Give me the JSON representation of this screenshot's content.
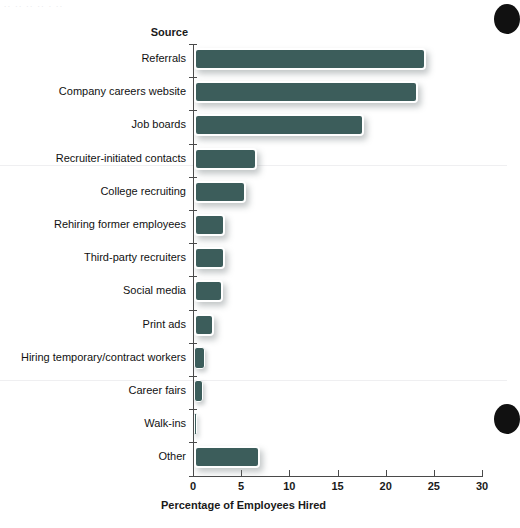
{
  "chart_data": {
    "type": "bar",
    "orientation": "horizontal",
    "title": "",
    "subtitle": "",
    "xlabel": "Percentage of Employees Hired",
    "ylabel": "Source",
    "xlim": [
      0,
      30
    ],
    "xticks": [
      0,
      5,
      10,
      15,
      20,
      25,
      30
    ],
    "xtick_labels": [
      "0",
      "5",
      "10",
      "15",
      "20",
      "25",
      "30"
    ],
    "grid": false,
    "legend": false,
    "bar_color": "#3c5d5b",
    "bar_outline_color": "#ffffff",
    "categories": [
      "Referrals",
      "Company careers website",
      "Job boards",
      "Recruiter-initiated contacts",
      "College recruiting",
      "Rehiring former employees",
      "Third-party recruiters",
      "Social media",
      "Print ads",
      "Hiring temporary/contract workers",
      "Career fairs",
      "Walk-ins",
      "Other"
    ],
    "values": [
      24.1,
      23.3,
      17.6,
      6.5,
      5.4,
      3.2,
      3.2,
      3.0,
      2.1,
      1.1,
      0.9,
      0.1,
      6.8
    ]
  },
  "axis": {
    "source_header": "Source",
    "x_title": "Percentage of Employees Hired"
  },
  "artifacts": {
    "scan_top_text": "..  ..   ..      ..    .  ..",
    "edge_circle_top": "dark-circle",
    "edge_circle_bottom": "dark-circle"
  }
}
